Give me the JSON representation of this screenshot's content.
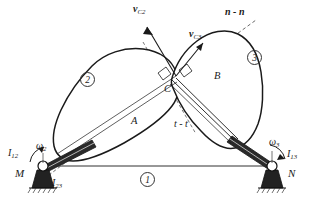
{
  "figure": {
    "kind": "mechanism-kinematics-diagram",
    "background_color": "#ffffff",
    "line_color": "#1a1a1a"
  },
  "labels": {
    "velocity_c2": {
      "base": "v",
      "sub": "C2",
      "text": "vC2"
    },
    "velocity_c3": {
      "base": "v",
      "sub": "C3",
      "text": "vC3"
    },
    "normal_line": "n - n",
    "tangent_line": "t - t",
    "contact_point": "C",
    "body_a": "A",
    "body_b": "B",
    "pivot_left": "M",
    "pivot_right": "N",
    "omega_2": {
      "base": "ω",
      "sub": "2"
    },
    "omega_3": {
      "base": "ω",
      "sub": "3"
    },
    "instant_centre_12": {
      "base": "I",
      "sub": "12"
    },
    "instant_centre_23": {
      "base": "I",
      "sub": "23"
    },
    "instant_centre_13": {
      "base": "I",
      "sub": "13"
    }
  },
  "link_numbers": {
    "ground": "1",
    "cam_two": "2",
    "cam_three": "3"
  }
}
